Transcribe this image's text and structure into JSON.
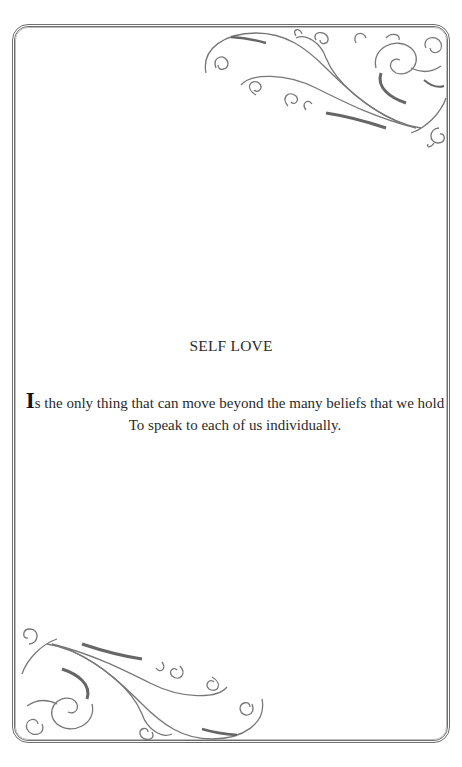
{
  "page": {
    "title": "SELF LOVE",
    "body": {
      "drop_cap": "I",
      "line1_rest": "s the only thing that can move beyond the many beliefs that we hold",
      "line2": "To speak to each of us individually."
    },
    "ornaments": {
      "top_right": "flourish-scroll-ornament",
      "bottom_left": "flourish-scroll-ornament"
    },
    "colors": {
      "border": "#6e6e6e",
      "ornament": "#777777",
      "text": "#2a2a2a"
    }
  }
}
